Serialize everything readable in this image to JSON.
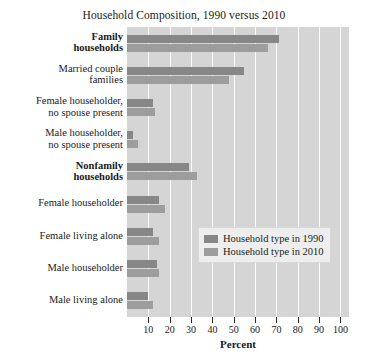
{
  "chart_data": {
    "type": "bar",
    "orientation": "horizontal",
    "title": "Household Composition, 1990 versus 2010",
    "xlabel": "Percent",
    "ylabel": "",
    "xlim": [
      0,
      104
    ],
    "xticks": [
      10,
      20,
      30,
      40,
      50,
      60,
      70,
      80,
      90,
      100
    ],
    "grid": true,
    "legend_position": "center-right",
    "categories": [
      "Family households",
      "Married couple families",
      "Female householder, no spouse present",
      "Male householder, no spouse present",
      "Nonfamily households",
      "Female householder",
      "Female living alone",
      "Male householder",
      "Male living alone"
    ],
    "category_lines": [
      [
        "Family",
        "households"
      ],
      [
        "Married couple",
        "families"
      ],
      [
        "Female householder,",
        "no spouse present"
      ],
      [
        "Male householder,",
        "no spouse present"
      ],
      [
        "Nonfamily",
        "households"
      ],
      [
        "Female householder"
      ],
      [
        "Female living alone"
      ],
      [
        "Male householder"
      ],
      [
        "Male living alone"
      ]
    ],
    "category_bold": [
      true,
      false,
      false,
      false,
      true,
      false,
      false,
      false,
      false
    ],
    "series": [
      {
        "name": "Household type in 1990",
        "color": "#878787",
        "values": [
          71,
          55,
          12,
          3,
          29,
          15,
          12,
          14,
          10
        ]
      },
      {
        "name": "Household type in 2010",
        "color": "#9d9d9d",
        "values": [
          66,
          48,
          13,
          5,
          33,
          18,
          15,
          15,
          12
        ]
      }
    ]
  },
  "legend": {
    "items": [
      {
        "label": "Household type in 1990",
        "color": "#878787"
      },
      {
        "label": "Household type in 2010",
        "color": "#9d9d9d"
      }
    ]
  },
  "axis": {
    "x_title": "Percent",
    "tick_labels": [
      "10",
      "20",
      "30",
      "40",
      "50",
      "60",
      "70",
      "80",
      "90",
      "100"
    ]
  },
  "colors": {
    "plot_background": "#d5d5d5",
    "gridline": "#fbfbfb",
    "legend_background": "#eeeeee",
    "series_1990": "#878787",
    "series_2010": "#9d9d9d",
    "text": "#1a1a1a"
  }
}
